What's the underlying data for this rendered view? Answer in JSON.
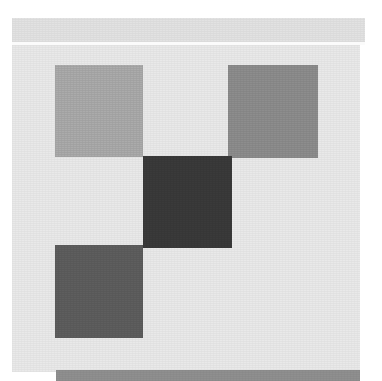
{
  "image": {
    "kind": "abstract-grayscale-composition",
    "width": 382,
    "height": 381,
    "background_color": "#ffffff"
  },
  "panel": {
    "name": "main-panel",
    "color": "#e9e9e9",
    "x": 12,
    "y": 18,
    "width": 348,
    "height": 354
  },
  "header_band": {
    "name": "header-band",
    "color": "#e2e2e2",
    "x": 12,
    "y": 18,
    "width": 353,
    "height": 24
  },
  "separator": {
    "name": "header-separator-rule",
    "color": "#fbfbfb",
    "x": 12,
    "y": 42,
    "width": 353,
    "height": 3
  },
  "squares": [
    {
      "name": "square-top-left",
      "tone": "light-gray",
      "color": "#ababab",
      "x": 55,
      "y": 65,
      "width": 88,
      "height": 92
    },
    {
      "name": "square-top-right",
      "tone": "medium-gray",
      "color": "#8d8d8d",
      "x": 228,
      "y": 65,
      "width": 90,
      "height": 93
    },
    {
      "name": "square-center-dark",
      "tone": "very-dark-gray",
      "color": "#3a3a3a",
      "x": 143,
      "y": 156,
      "width": 89,
      "height": 92
    },
    {
      "name": "square-bottom-left",
      "tone": "dark-gray",
      "color": "#5e5e5e",
      "x": 55,
      "y": 245,
      "width": 88,
      "height": 93
    }
  ],
  "footer_bar": {
    "name": "footer-bar",
    "color": "#8f8f8f",
    "x": 56,
    "y": 370,
    "width": 304,
    "height": 11
  }
}
